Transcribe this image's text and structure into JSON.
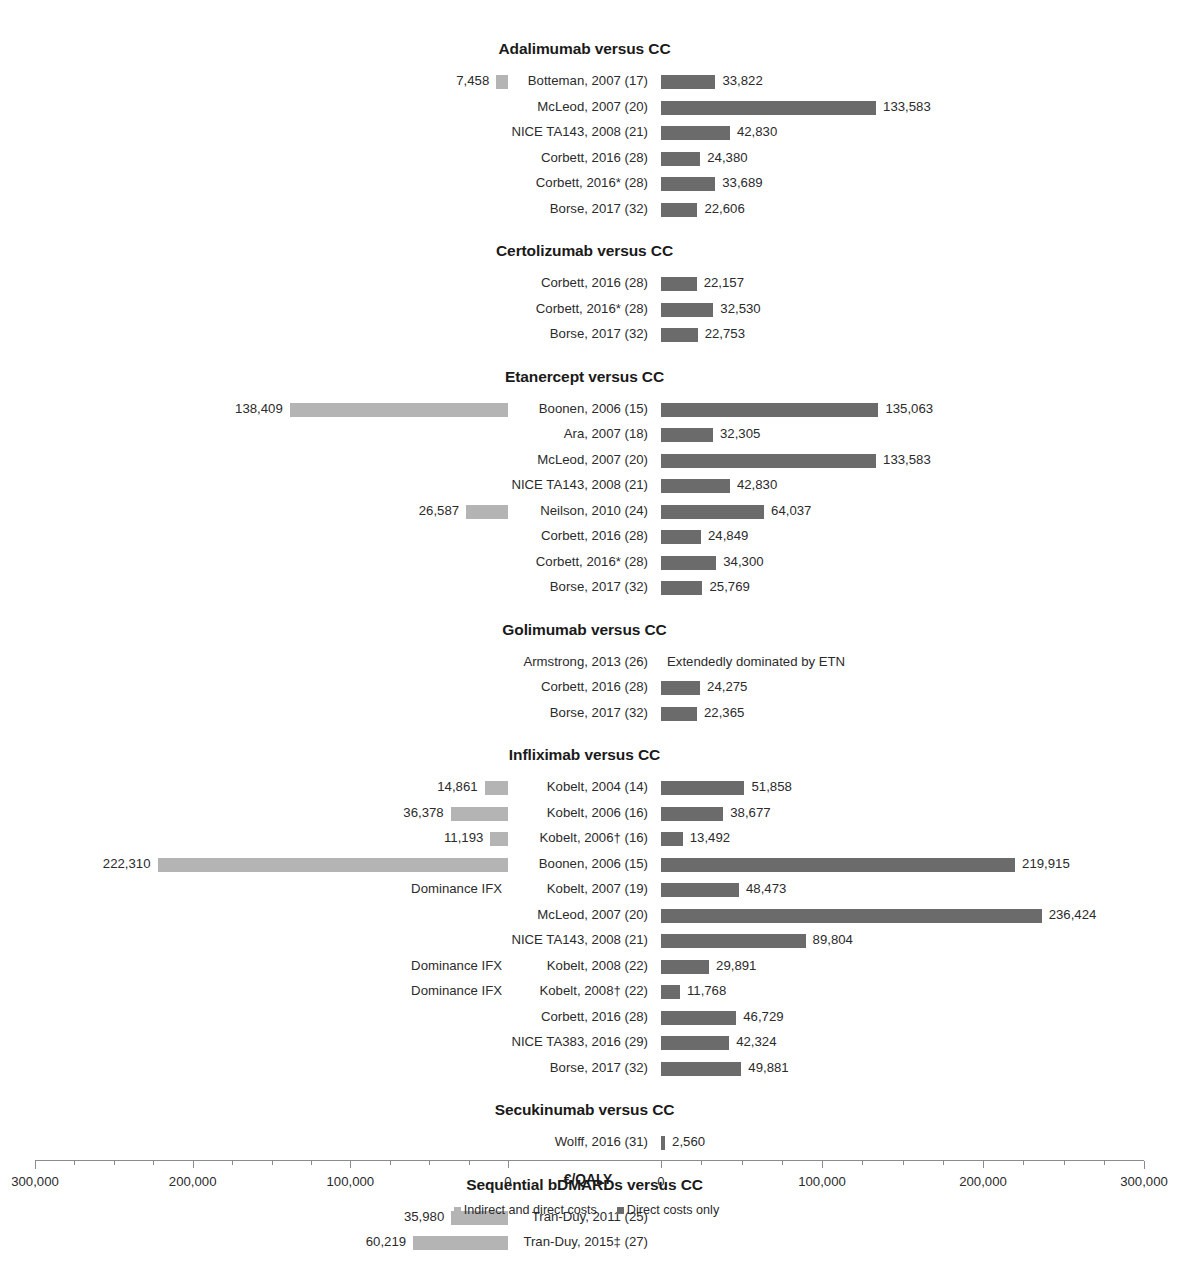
{
  "chart_data": {
    "type": "bar",
    "title": "",
    "xlabel": "€/QALY",
    "ylabel": "",
    "orientation": "horizontal-mirrored",
    "axis": {
      "title": "€/QALY",
      "left_axis_label": "Indirect and direct costs",
      "right_axis_label": "Direct costs only",
      "left_ticks": [
        "300,000",
        "200,000",
        "100,000",
        "0"
      ],
      "right_ticks": [
        "0",
        "100,000",
        "200,000",
        "300,000"
      ],
      "left_range": [
        300000,
        0
      ],
      "right_range": [
        0,
        300000
      ],
      "minor_tick_step": 25000,
      "grid": false
    },
    "legend": {
      "position": "bottom-center",
      "entries": [
        {
          "label": "Indirect and direct costs",
          "color": "#b4b4b4"
        },
        {
          "label": "Direct costs only",
          "color": "#6b6b6b"
        }
      ]
    },
    "colors": {
      "indirect_and_direct": "#b4b4b4",
      "direct_only": "#6b6b6b"
    },
    "groups": [
      {
        "title": "Adalimumab versus CC",
        "rows": [
          {
            "label": "Botteman, 2007 (17)",
            "left_value": 7458,
            "left_text": "7,458",
            "right_value": 33822,
            "right_text": "33,822"
          },
          {
            "label": "McLeod, 2007 (20)",
            "left_value": null,
            "left_text": "",
            "right_value": 133583,
            "right_text": "133,583"
          },
          {
            "label": "NICE TA143, 2008 (21)",
            "left_value": null,
            "left_text": "",
            "right_value": 42830,
            "right_text": "42,830"
          },
          {
            "label": "Corbett, 2016 (28)",
            "left_value": null,
            "left_text": "",
            "right_value": 24380,
            "right_text": "24,380"
          },
          {
            "label": "Corbett, 2016* (28)",
            "left_value": null,
            "left_text": "",
            "right_value": 33689,
            "right_text": "33,689"
          },
          {
            "label": "Borse, 2017 (32)",
            "left_value": null,
            "left_text": "",
            "right_value": 22606,
            "right_text": "22,606"
          }
        ]
      },
      {
        "title": "Certolizumab versus CC",
        "rows": [
          {
            "label": "Corbett, 2016 (28)",
            "left_value": null,
            "left_text": "",
            "right_value": 22157,
            "right_text": "22,157"
          },
          {
            "label": "Corbett, 2016* (28)",
            "left_value": null,
            "left_text": "",
            "right_value": 32530,
            "right_text": "32,530"
          },
          {
            "label": "Borse, 2017 (32)",
            "left_value": null,
            "left_text": "",
            "right_value": 22753,
            "right_text": "22,753"
          }
        ]
      },
      {
        "title": "Etanercept versus CC",
        "rows": [
          {
            "label": "Boonen, 2006 (15)",
            "left_value": 138409,
            "left_text": "138,409",
            "right_value": 135063,
            "right_text": "135,063"
          },
          {
            "label": "Ara, 2007 (18)",
            "left_value": null,
            "left_text": "",
            "right_value": 32305,
            "right_text": "32,305"
          },
          {
            "label": "McLeod, 2007 (20)",
            "left_value": null,
            "left_text": "",
            "right_value": 133583,
            "right_text": "133,583"
          },
          {
            "label": "NICE TA143, 2008 (21)",
            "left_value": null,
            "left_text": "",
            "right_value": 42830,
            "right_text": "42,830"
          },
          {
            "label": "Neilson, 2010 (24)",
            "left_value": 26587,
            "left_text": "26,587",
            "right_value": 64037,
            "right_text": "64,037"
          },
          {
            "label": "Corbett, 2016 (28)",
            "left_value": null,
            "left_text": "",
            "right_value": 24849,
            "right_text": "24,849"
          },
          {
            "label": "Corbett, 2016* (28)",
            "left_value": null,
            "left_text": "",
            "right_value": 34300,
            "right_text": "34,300"
          },
          {
            "label": "Borse, 2017 (32)",
            "left_value": null,
            "left_text": "",
            "right_value": 25769,
            "right_text": "25,769"
          }
        ]
      },
      {
        "title": "Golimumab versus CC",
        "rows": [
          {
            "label": "Armstrong, 2013 (26)",
            "left_value": null,
            "left_text": "",
            "right_value": null,
            "right_text": "",
            "right_note": "Extendedly dominated by ETN"
          },
          {
            "label": "Corbett, 2016 (28)",
            "left_value": null,
            "left_text": "",
            "right_value": 24275,
            "right_text": "24,275"
          },
          {
            "label": "Borse, 2017 (32)",
            "left_value": null,
            "left_text": "",
            "right_value": 22365,
            "right_text": "22,365"
          }
        ]
      },
      {
        "title": "Infliximab versus CC",
        "rows": [
          {
            "label": "Kobelt, 2004 (14)",
            "left_value": 14861,
            "left_text": "14,861",
            "right_value": 51858,
            "right_text": "51,858"
          },
          {
            "label": "Kobelt, 2006 (16)",
            "left_value": 36378,
            "left_text": "36,378",
            "right_value": 38677,
            "right_text": "38,677"
          },
          {
            "label": "Kobelt, 2006† (16)",
            "left_value": 11193,
            "left_text": "11,193",
            "right_value": 13492,
            "right_text": "13,492"
          },
          {
            "label": "Boonen, 2006 (15)",
            "left_value": 222310,
            "left_text": "222,310",
            "right_value": 219915,
            "right_text": "219,915"
          },
          {
            "label": "Kobelt, 2007 (19)",
            "left_value": null,
            "left_text": "",
            "left_note": "Dominance IFX",
            "right_value": 48473,
            "right_text": "48,473"
          },
          {
            "label": "McLeod, 2007 (20)",
            "left_value": null,
            "left_text": "",
            "right_value": 236424,
            "right_text": "236,424"
          },
          {
            "label": "NICE TA143, 2008 (21)",
            "left_value": null,
            "left_text": "",
            "right_value": 89804,
            "right_text": "89,804"
          },
          {
            "label": "Kobelt, 2008 (22)",
            "left_value": null,
            "left_text": "",
            "left_note": "Dominance IFX",
            "right_value": 29891,
            "right_text": "29,891"
          },
          {
            "label": "Kobelt, 2008† (22)",
            "left_value": null,
            "left_text": "",
            "left_note": "Dominance IFX",
            "right_value": 11768,
            "right_text": "11,768"
          },
          {
            "label": "Corbett, 2016 (28)",
            "left_value": null,
            "left_text": "",
            "right_value": 46729,
            "right_text": "46,729"
          },
          {
            "label": "NICE TA383, 2016 (29)",
            "left_value": null,
            "left_text": "",
            "right_value": 42324,
            "right_text": "42,324"
          },
          {
            "label": "Borse, 2017 (32)",
            "left_value": null,
            "left_text": "",
            "right_value": 49881,
            "right_text": "49,881"
          }
        ]
      },
      {
        "title": "Secukinumab versus CC",
        "rows": [
          {
            "label": "Wolff, 2016 (31)",
            "left_value": null,
            "left_text": "",
            "right_value": 2560,
            "right_text": "2,560"
          }
        ]
      },
      {
        "title": "Sequential bDMARDs versus CC",
        "rows": [
          {
            "label": "Tran-Duy, 2011 (25)",
            "left_value": 35980,
            "left_text": "35,980",
            "right_value": null,
            "right_text": ""
          },
          {
            "label": "Tran-Duy, 2015‡ (27)",
            "left_value": 60219,
            "left_text": "60,219",
            "right_value": null,
            "right_text": ""
          }
        ]
      }
    ]
  }
}
